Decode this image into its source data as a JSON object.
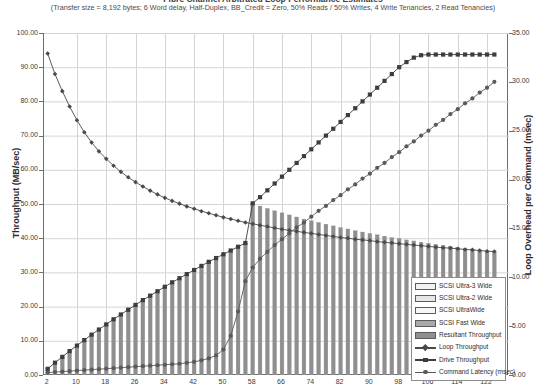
{
  "chart_data": {
    "type": "bar",
    "title": "Fibre Channel Arbitrated Loop Performance Estimates",
    "subtitle": "(Transfer size = 8,192 bytes; 6 Word delay, Half-Duplex, BB_Credit = Zero, 50% Reads / 50% Writes, 4 Write Tenancies, 2 Read Tenancies)",
    "xlabel": "",
    "ylabel": "Throughput (MB/sec)",
    "y2label": "Loop Overhead per Command (msec)",
    "ylim": [
      0,
      100
    ],
    "y2lim": [
      0,
      35
    ],
    "xlim": [
      1,
      128
    ],
    "grid": true,
    "legend_position": "inside-bottom-right",
    "y_ticks": [
      "0.00",
      "10.00",
      "20.00",
      "30.00",
      "40.00",
      "50.00",
      "60.00",
      "70.00",
      "80.00",
      "90.00",
      "100.00"
    ],
    "y2_ticks": [
      "0.00",
      "5.00",
      "10.00",
      "15.00",
      "20.00",
      "25.00",
      "30.00",
      "35.00"
    ],
    "x_ticks": [
      2,
      10,
      18,
      26,
      34,
      42,
      50,
      58,
      66,
      74,
      82,
      90,
      98,
      106,
      114,
      122
    ],
    "x": [
      2,
      4,
      6,
      8,
      10,
      12,
      14,
      16,
      18,
      20,
      22,
      24,
      26,
      28,
      30,
      32,
      34,
      36,
      38,
      40,
      42,
      44,
      46,
      48,
      50,
      52,
      54,
      56,
      58,
      60,
      62,
      64,
      66,
      68,
      70,
      72,
      74,
      76,
      78,
      80,
      82,
      84,
      86,
      88,
      90,
      92,
      94,
      96,
      98,
      100,
      102,
      104,
      106,
      108,
      110,
      112,
      114,
      116,
      118,
      120,
      122,
      124
    ],
    "series": [
      {
        "name": "Resultant Throughput",
        "type": "bar",
        "axis": "left",
        "color": "#8f8f8f",
        "values": [
          1.8,
          3.6,
          5.3,
          7.0,
          8.6,
          10.2,
          11.8,
          13.3,
          14.8,
          16.3,
          17.7,
          19.1,
          20.5,
          21.9,
          23.2,
          24.5,
          25.8,
          27.1,
          28.3,
          29.5,
          30.7,
          31.9,
          33.1,
          34.2,
          35.3,
          36.4,
          37.5,
          38.6,
          50.2,
          49.4,
          48.7,
          48.0,
          47.4,
          46.8,
          46.2,
          45.6,
          45.1,
          44.6,
          44.1,
          43.6,
          43.1,
          42.7,
          42.2,
          41.8,
          41.4,
          41.0,
          40.6,
          40.2,
          39.9,
          39.5,
          39.2,
          38.8,
          38.5,
          38.2,
          37.9,
          37.6,
          37.3,
          37.0,
          36.7,
          36.4,
          36.2,
          35.9
        ]
      },
      {
        "name": "Loop Throughput",
        "type": "line",
        "axis": "left",
        "marker": "diamond",
        "color": "#4a4a4a",
        "values": [
          94.0,
          88.0,
          83.0,
          78.5,
          74.5,
          71.0,
          68.0,
          65.4,
          63.2,
          61.2,
          59.4,
          57.8,
          56.4,
          55.1,
          53.9,
          52.8,
          51.8,
          50.9,
          50.1,
          49.3,
          48.6,
          47.9,
          47.3,
          46.7,
          46.1,
          45.6,
          45.1,
          44.6,
          44.2,
          43.8,
          43.4,
          43.0,
          42.6,
          42.3,
          42.0,
          41.7,
          41.4,
          41.1,
          40.8,
          40.5,
          40.2,
          40.0,
          39.7,
          39.5,
          39.3,
          39.0,
          38.8,
          38.6,
          38.4,
          38.2,
          38.0,
          37.8,
          37.6,
          37.4,
          37.2,
          37.1,
          36.9,
          36.7,
          36.6,
          36.4,
          36.2,
          36.1
        ]
      },
      {
        "name": "Drive Throughput",
        "type": "line",
        "axis": "left",
        "marker": "square",
        "color": "#3d3d3d",
        "values": [
          1.8,
          3.6,
          5.3,
          7.0,
          8.6,
          10.2,
          11.8,
          13.3,
          14.8,
          16.3,
          17.7,
          19.1,
          20.5,
          21.9,
          23.2,
          24.5,
          25.8,
          27.1,
          28.3,
          29.5,
          30.7,
          31.9,
          33.1,
          34.2,
          35.3,
          36.4,
          37.5,
          38.6,
          50.2,
          52.0,
          54.0,
          56.0,
          58.0,
          60.0,
          62.0,
          64.0,
          66.0,
          68.0,
          70.0,
          72.0,
          74.0,
          76.0,
          78.0,
          80.0,
          82.0,
          84.0,
          86.0,
          88.0,
          90.0,
          91.5,
          92.8,
          93.5,
          93.7,
          93.7,
          93.7,
          93.7,
          93.7,
          93.7,
          93.7,
          93.7,
          93.7,
          93.7
        ]
      },
      {
        "name": "Command Latency (msec)",
        "type": "line",
        "axis": "right",
        "marker": "circle",
        "color": "#5a5a5a",
        "values": [
          0.25,
          0.3,
          0.35,
          0.4,
          0.45,
          0.5,
          0.55,
          0.6,
          0.65,
          0.7,
          0.75,
          0.8,
          0.85,
          0.9,
          0.95,
          1.0,
          1.05,
          1.1,
          1.15,
          1.25,
          1.35,
          1.5,
          1.7,
          2.0,
          2.6,
          4.0,
          6.5,
          9.6,
          11.0,
          11.9,
          12.6,
          13.3,
          13.9,
          14.5,
          15.1,
          15.6,
          16.2,
          16.8,
          17.3,
          17.9,
          18.4,
          19.0,
          19.5,
          20.1,
          20.6,
          21.2,
          21.7,
          22.3,
          22.8,
          23.4,
          23.9,
          24.5,
          25.0,
          25.6,
          26.1,
          26.7,
          27.2,
          27.8,
          28.3,
          28.9,
          29.4,
          30.0
        ]
      }
    ],
    "legend": [
      {
        "label": "SCSI Ultra-3 Wide",
        "key": "swatch",
        "fill": "#f2f2f2"
      },
      {
        "label": "SCSI Ultra-2 Wide",
        "key": "swatch",
        "fill": "#e6e6e6"
      },
      {
        "label": "SCSI UltraWide",
        "key": "swatch",
        "fill": "#f7f7f7"
      },
      {
        "label": "SCSI Fast Wide",
        "key": "swatch",
        "fill": "#a8a8a8"
      },
      {
        "label": "Resultant Throughput",
        "key": "swatch",
        "fill": "#909090"
      },
      {
        "label": "Loop Throughput",
        "key": "line",
        "marker": "diamond",
        "color": "#4a4a4a"
      },
      {
        "label": "Drive Throughput",
        "key": "line",
        "marker": "square",
        "color": "#3d3d3d"
      },
      {
        "label": "Command Latency (msec)",
        "key": "line",
        "marker": "circle",
        "color": "#5a5a5a"
      }
    ]
  }
}
